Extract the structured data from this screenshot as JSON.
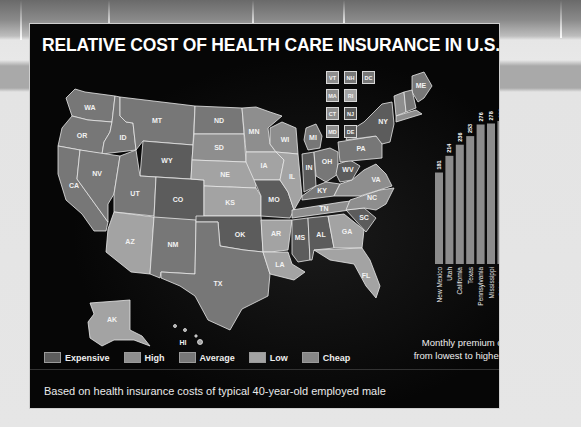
{
  "title": "RELATIVE COST OF HEALTH CARE INSURANCE IN U.S. STATES",
  "footnote": "Based on health insurance costs of typical 40-year-old employed male",
  "colors": {
    "expensive": "#5c5c5c",
    "high": "#8e8e8e",
    "average": "#777777",
    "low": "#a3a3a3",
    "cheap": "#878787",
    "panel": "#060606",
    "bar": "#8c8c8c"
  },
  "legend": [
    {
      "key": "expensive",
      "label": "Expensive"
    },
    {
      "key": "high",
      "label": "High"
    },
    {
      "key": "average",
      "label": "Average"
    },
    {
      "key": "low",
      "label": "Low"
    },
    {
      "key": "cheap",
      "label": "Cheap"
    }
  ],
  "small_states": [
    {
      "abbr": "VT",
      "cat": "high"
    },
    {
      "abbr": "NH",
      "cat": "average"
    },
    {
      "abbr": "DC",
      "cat": "average"
    },
    {
      "abbr": "MA",
      "cat": "high"
    },
    {
      "abbr": "RI",
      "cat": "low"
    },
    {
      "abbr": "CT",
      "cat": "high"
    },
    {
      "abbr": "NJ",
      "cat": "expensive"
    },
    {
      "abbr": "MD",
      "cat": "high"
    },
    {
      "abbr": "DE",
      "cat": "expensive"
    }
  ],
  "states": {
    "WA": "average",
    "OR": "average",
    "CA": "average",
    "ID": "average",
    "NV": "average",
    "MT": "average",
    "WY": "expensive",
    "UT": "average",
    "CO": "expensive",
    "AZ": "low",
    "NM": "average",
    "ND": "average",
    "SD": "high",
    "NE": "low",
    "KS": "low",
    "OK": "expensive",
    "TX": "average",
    "MN": "high",
    "IA": "low",
    "MO": "expensive",
    "AR": "low",
    "LA": "low",
    "WI": "high",
    "IL": "low",
    "MI": "average",
    "IN": "expensive",
    "OH": "average",
    "KY": "average",
    "TN": "high",
    "MS": "expensive",
    "AL": "expensive",
    "GA": "low",
    "FL": "low",
    "SC": "expensive",
    "NC": "high",
    "VA": "high",
    "WV": "expensive",
    "PA": "average",
    "NY": "expensive",
    "ME": "average",
    "AK": "low",
    "HI": "low"
  },
  "chart_data": {
    "type": "bar",
    "title": "",
    "caption": "Monthly premium costs, from lowest to highest (in $)",
    "caption_lines": [
      "Monthly premium costs,",
      "from lowest to highest (in $)"
    ],
    "categories": [
      "New Mexico",
      "Utah",
      "California",
      "Texas",
      "Pennsylvania",
      "Mississippi",
      "Oklahoma",
      "Alabama",
      "New Jersey",
      "New York"
    ],
    "values": [
      181,
      214,
      236,
      253,
      276,
      278,
      283,
      288,
      317,
      366
    ],
    "xlabel": "",
    "ylabel": "Monthly premium ($)",
    "ylim": [
      0,
      366
    ],
    "grid": false,
    "orientation": "vertical",
    "label_rotation": "vertical"
  }
}
